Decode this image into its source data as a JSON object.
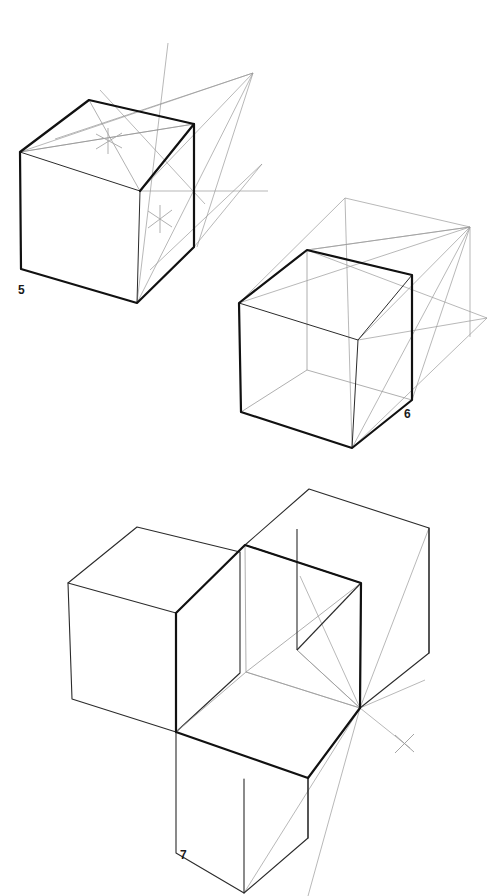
{
  "document": {
    "title": "Perspective Cube Construction Exercises",
    "subject": "Two-point perspective cube drawing: diagonals, vanishing points and cube duplication",
    "medium": "pencil line drawing on white paper",
    "background_color": "#ffffff"
  },
  "styles": {
    "heavy_line_color": "#111111",
    "medium_line_color": "#2b2b2b",
    "construction_line_color": "#9a9a9a",
    "faint_line_color": "#b3b3b3",
    "label_color": "#1a1a1a",
    "heavy_line_width": "2.2",
    "medium_line_width": "1.1",
    "construction_line_width": "0.7"
  },
  "figures": [
    {
      "id": "figure-5",
      "number": "5",
      "label_position": {
        "x": 18,
        "y": 294
      },
      "caption": "Cube with diagonals drawn on top and front faces to locate face centres; lines projected to the right vanishing point.",
      "features": [
        "heavy outlined cube",
        "diagonal cross on top face",
        "diagonal cross on right face",
        "converging construction lines to vanishing point",
        "horizon guide line"
      ],
      "cube": {
        "front_top_left": {
          "x": 20,
          "y": 152
        },
        "front_top_right": {
          "x": 140,
          "y": 191
        },
        "back_top_left": {
          "x": 89,
          "y": 100
        },
        "back_top_right": {
          "x": 194,
          "y": 124
        },
        "front_bottom_left": {
          "x": 21,
          "y": 269
        },
        "front_bottom_right": {
          "x": 137,
          "y": 303
        },
        "right_bottom": {
          "x": 194,
          "y": 247
        }
      },
      "vanishing_point": {
        "x": 253,
        "y": 73
      },
      "center_marks": [
        {
          "name": "top-face-center",
          "x": 108,
          "y": 141
        },
        {
          "name": "right-face-center",
          "x": 160,
          "y": 219
        }
      ]
    },
    {
      "id": "figure-6",
      "number": "6",
      "label_position": {
        "x": 404,
        "y": 418
      },
      "caption": "Transparent cube showing hidden back edges, with a second cube projected behind it toward the vanishing point.",
      "features": [
        "transparent cube with visible hidden edges",
        "duplicate ghost cube projected to the rear",
        "convergence lines to right vanishing point"
      ],
      "cube": {
        "front_top_left": {
          "x": 239,
          "y": 303
        },
        "front_top_right": {
          "x": 358,
          "y": 340
        },
        "back_top_left": {
          "x": 307,
          "y": 250
        },
        "back_top_right": {
          "x": 412,
          "y": 275
        },
        "front_bottom_left": {
          "x": 241,
          "y": 412
        },
        "front_bottom_right": {
          "x": 352,
          "y": 448
        },
        "right_bottom": {
          "x": 412,
          "y": 400
        }
      },
      "vanishing_point": {
        "x": 470,
        "y": 227
      },
      "center_marks": []
    },
    {
      "id": "figure-7",
      "number": "7",
      "label_position": {
        "x": 180,
        "y": 859
      },
      "caption": "Three cubes assembled as an L-shaped block: one to the left, one to the right and one below the central transparent cube, all sharing a common vanishing point.",
      "features": [
        "central transparent cube with heavy outline",
        "left adjoining cube",
        "right adjoining cube",
        "lower adjoining cube",
        "convergence lines and X mark at the vanishing point"
      ],
      "cubes": [
        {
          "name": "center-cube",
          "emphasis": "heavy"
        },
        {
          "name": "left-cube",
          "emphasis": "medium"
        },
        {
          "name": "right-cube",
          "emphasis": "medium"
        },
        {
          "name": "bottom-cube",
          "emphasis": "medium"
        }
      ],
      "vanishing_point": {
        "x": 360,
        "y": 708
      },
      "center_marks": [
        {
          "name": "vanishing-point-x-mark",
          "x": 404,
          "y": 743
        }
      ]
    }
  ]
}
